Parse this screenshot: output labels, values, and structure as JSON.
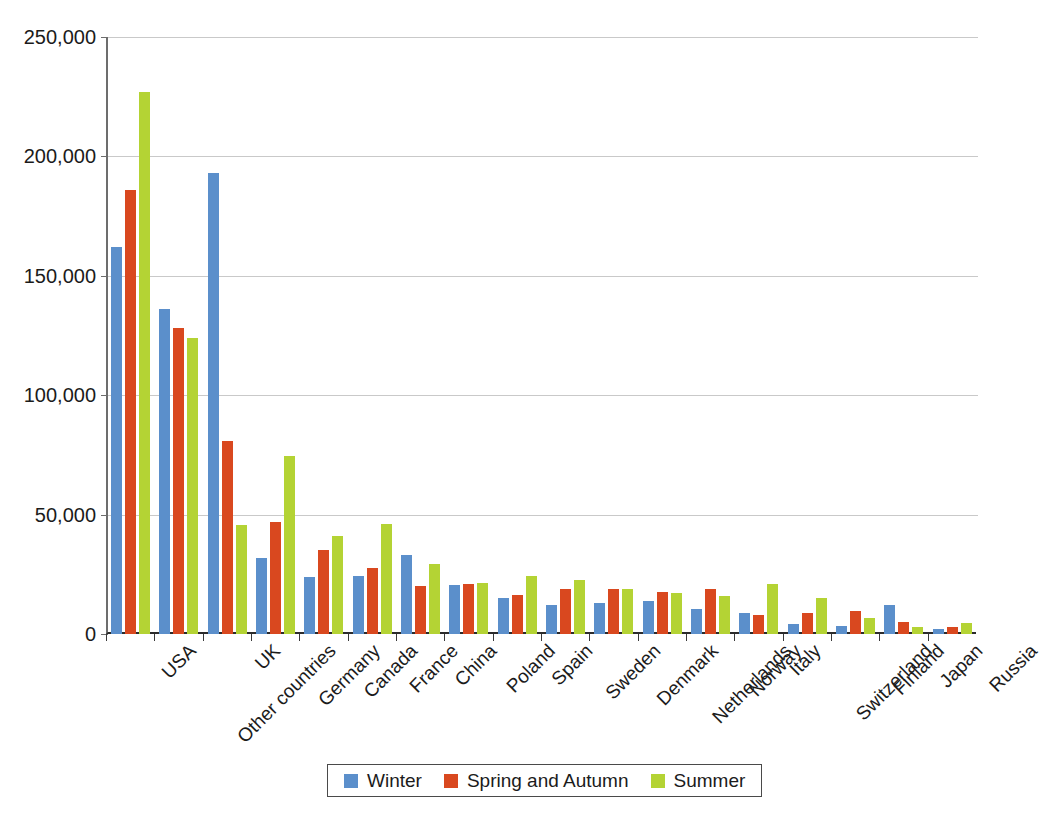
{
  "chart_data": {
    "type": "bar",
    "title": "",
    "subtitle": "",
    "xlabel": "",
    "ylabel": "",
    "ylim": [
      0,
      250000
    ],
    "yticks": [
      0,
      50000,
      100000,
      150000,
      200000,
      250000
    ],
    "ytick_labels": [
      "0",
      "50,000",
      "100,000",
      "150,000",
      "200,000",
      "250,000"
    ],
    "grid": true,
    "legend_position": "bottom",
    "categories": [
      "USA",
      "Other countries",
      "UK",
      "Germany",
      "Canada",
      "France",
      "China",
      "Poland",
      "Spain",
      "Sweden",
      "Denmark",
      "Netherlands",
      "Norway",
      "Italy",
      "Switzerland",
      "Finland",
      "Japan",
      "Russia"
    ],
    "series": [
      {
        "name": "Winter",
        "color": "#5b8fcb",
        "values": [
          162000,
          136000,
          193000,
          32000,
          24000,
          24500,
          33000,
          20500,
          15000,
          12000,
          13000,
          14000,
          10500,
          9000,
          4000,
          3500,
          12000,
          2000
        ]
      },
      {
        "name": "Spring and Autumn",
        "color": "#d9481f",
        "values": [
          186000,
          128000,
          81000,
          47000,
          35000,
          27500,
          20000,
          21000,
          16500,
          19000,
          19000,
          17500,
          19000,
          8000,
          9000,
          9500,
          5000,
          3000
        ]
      },
      {
        "name": "Summer",
        "color": "#b4d334",
        "values": [
          227000,
          124000,
          45500,
          74500,
          41000,
          46000,
          29500,
          21500,
          24500,
          22500,
          19000,
          17000,
          16000,
          21000,
          15000,
          6500,
          3000,
          4500
        ]
      }
    ]
  },
  "legend": {
    "entries": [
      {
        "label": "Winter",
        "color": "#5b8fcb"
      },
      {
        "label": "Spring and Autumn",
        "color": "#d9481f"
      },
      {
        "label": "Summer",
        "color": "#b4d334"
      }
    ]
  }
}
